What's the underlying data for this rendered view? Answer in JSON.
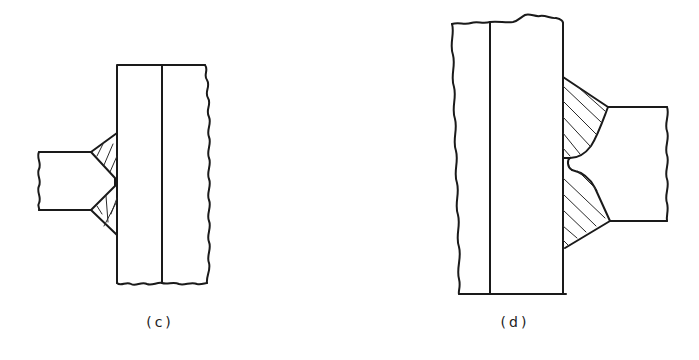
{
  "figure": {
    "type": "technical-drawing",
    "stroke_color": "#1a1a1a",
    "background": "#ffffff",
    "panels": [
      {
        "id": "c",
        "label": "(c)",
        "description": "Double-bevel plate welded to web plate with two small fillet/groove welds, hatched",
        "label_pos": {
          "x": 160,
          "y": 314
        }
      },
      {
        "id": "d",
        "label": "(d)",
        "description": "Double-bevel plate welded to thick web with large hatched groove welds and root notch",
        "label_pos": {
          "x": 515,
          "y": 314
        }
      }
    ]
  }
}
